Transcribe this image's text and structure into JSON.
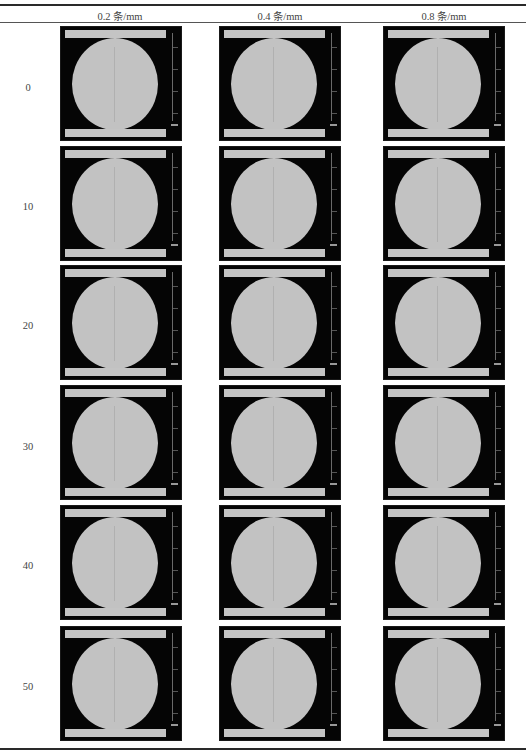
{
  "table": {
    "caption_fragment": "",
    "column_headers": [
      "0.2 条/mm",
      "0.4 条/mm",
      "0.8 条/mm"
    ],
    "row_labels": [
      "0",
      "10",
      "20",
      "30",
      "40",
      "50"
    ],
    "cells": [
      [
        "CT slice: disc specimen, 0.2 条/mm, row 0",
        "CT slice: disc specimen, 0.4 条/mm, row 0",
        "CT slice: disc specimen, 0.8 条/mm, row 0"
      ],
      [
        "CT slice: disc specimen, 0.2 条/mm, row 10",
        "CT slice: disc specimen, 0.4 条/mm, row 10",
        "CT slice: disc specimen, 0.8 条/mm, row 10"
      ],
      [
        "CT slice: disc specimen, 0.2 条/mm, row 20",
        "CT slice: disc specimen, 0.4 条/mm, row 20",
        "CT slice: disc specimen, 0.8 条/mm, row 20"
      ],
      [
        "CT slice: disc specimen, 0.2 条/mm, row 30",
        "CT slice: disc specimen, 0.4 条/mm, row 30",
        "CT slice: disc specimen, 0.8 条/mm, row 30"
      ],
      [
        "CT slice: disc specimen, 0.2 条/mm, row 40",
        "CT slice: disc specimen, 0.4 条/mm, row 40",
        "CT slice: disc specimen, 0.8 条/mm, row 40"
      ],
      [
        "CT slice: disc specimen, 0.2 条/mm, row 50",
        "CT slice: disc specimen, 0.4 条/mm, row 50",
        "CT slice: disc specimen, 0.8 条/mm, row 50"
      ]
    ]
  },
  "colors": {
    "image_background": "#050505",
    "specimen_gray": "#c2c2c2",
    "rule": "#2a2a2a"
  }
}
